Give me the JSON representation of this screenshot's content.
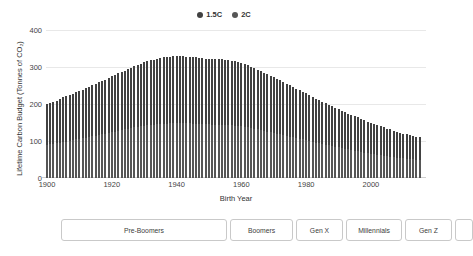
{
  "chart_data": {
    "type": "bar",
    "title": "",
    "xlabel": "Birth Year",
    "ylabel": "Lifetime Carbon Budget (Tonnes of CO2)",
    "ylabel_display": "Lifetime Carbon Budget (Tonnes of CO₂)",
    "xlim": [
      1900,
      2017
    ],
    "ylim": [
      0,
      430
    ],
    "yticks": [
      0,
      100,
      200,
      300,
      400
    ],
    "ytick_labels": [
      "0",
      "100",
      "200",
      "300",
      "400"
    ],
    "xticks": [
      1900,
      1920,
      1940,
      1960,
      1980,
      2000
    ],
    "xtick_labels": [
      "1900",
      "1920",
      "1940",
      "1960",
      "1980",
      "2000"
    ],
    "grid": "horizontal",
    "legend_position": "top-center",
    "stacked": true,
    "colors": {
      "1.5C": "#414141",
      "2C": "#565656",
      "grid": "#e8e8e8",
      "axis": "#cfcfcf"
    },
    "x": [
      1900,
      1901,
      1902,
      1903,
      1904,
      1905,
      1906,
      1907,
      1908,
      1909,
      1910,
      1911,
      1912,
      1913,
      1914,
      1915,
      1916,
      1917,
      1918,
      1919,
      1920,
      1921,
      1922,
      1923,
      1924,
      1925,
      1926,
      1927,
      1928,
      1929,
      1930,
      1931,
      1932,
      1933,
      1934,
      1935,
      1936,
      1937,
      1938,
      1939,
      1940,
      1941,
      1942,
      1943,
      1944,
      1945,
      1946,
      1947,
      1948,
      1949,
      1950,
      1951,
      1952,
      1953,
      1954,
      1955,
      1956,
      1957,
      1958,
      1959,
      1960,
      1961,
      1962,
      1963,
      1964,
      1965,
      1966,
      1967,
      1968,
      1969,
      1970,
      1971,
      1972,
      1973,
      1974,
      1975,
      1976,
      1977,
      1978,
      1979,
      1980,
      1981,
      1982,
      1983,
      1984,
      1985,
      1986,
      1987,
      1988,
      1989,
      1990,
      1991,
      1992,
      1993,
      1994,
      1995,
      1996,
      1997,
      1998,
      1999,
      2000,
      2001,
      2002,
      2003,
      2004,
      2005,
      2006,
      2007,
      2008,
      2009,
      2010,
      2011,
      2012,
      2013,
      2014,
      2015
    ],
    "series": [
      {
        "name": "1.5C",
        "values": [
          118,
          120,
          122,
          124,
          126,
          129,
          131,
          133,
          135,
          137,
          139,
          142,
          144,
          146,
          148,
          150,
          153,
          155,
          157,
          160,
          162,
          164,
          167,
          169,
          171,
          174,
          176,
          178,
          180,
          182,
          184,
          186,
          188,
          189,
          191,
          192,
          193,
          194,
          194,
          195,
          195,
          195,
          195,
          194,
          194,
          193,
          193,
          192,
          192,
          191,
          191,
          190,
          190,
          190,
          190,
          190,
          189,
          188,
          187,
          185,
          184,
          182,
          180,
          178,
          176,
          174,
          172,
          169,
          167,
          164,
          162,
          159,
          157,
          154,
          151,
          149,
          146,
          143,
          141,
          138,
          136,
          133,
          131,
          128,
          126,
          123,
          121,
          118,
          116,
          113,
          111,
          109,
          106,
          104,
          102,
          100,
          98,
          96,
          94,
          92,
          90,
          88,
          86,
          84,
          82,
          80,
          79,
          77,
          75,
          74,
          72,
          71,
          69,
          68,
          67,
          66
        ]
      },
      {
        "name": "2C",
        "values": [
          97,
          98,
          100,
          101,
          103,
          105,
          106,
          108,
          110,
          112,
          113,
          115,
          117,
          119,
          121,
          123,
          125,
          127,
          129,
          131,
          133,
          135,
          137,
          139,
          141,
          143,
          145,
          147,
          149,
          150,
          152,
          153,
          154,
          155,
          156,
          157,
          158,
          158,
          159,
          159,
          159,
          159,
          159,
          159,
          159,
          158,
          158,
          157,
          157,
          156,
          156,
          155,
          155,
          155,
          155,
          154,
          154,
          153,
          152,
          151,
          150,
          148,
          147,
          145,
          143,
          141,
          139,
          137,
          135,
          133,
          131,
          129,
          127,
          124,
          122,
          120,
          118,
          116,
          114,
          112,
          110,
          108,
          105,
          103,
          101,
          99,
          97,
          95,
          93,
          91,
          89,
          87,
          85,
          83,
          81,
          79,
          78,
          76,
          74,
          72,
          71,
          69,
          68,
          66,
          65,
          63,
          62,
          61,
          59,
          58,
          57,
          56,
          55,
          54,
          53,
          52
        ]
      }
    ],
    "totals": [
      215,
      218,
      222,
      225,
      229,
      234,
      237,
      241,
      245,
      249,
      252,
      257,
      261,
      265,
      269,
      273,
      278,
      282,
      286,
      291,
      295,
      299,
      304,
      308,
      312,
      317,
      321,
      325,
      329,
      332,
      336,
      339,
      342,
      344,
      347,
      349,
      351,
      352,
      353,
      354,
      354,
      354,
      354,
      353,
      353,
      351,
      351,
      349,
      349,
      347,
      347,
      345,
      345,
      345,
      345,
      344,
      343,
      341,
      339,
      336,
      334,
      330,
      327,
      323,
      319,
      315,
      311,
      306,
      302,
      297,
      293,
      288,
      284,
      278,
      273,
      269,
      264,
      259,
      255,
      250,
      246,
      241,
      236,
      231,
      227,
      222,
      218,
      213,
      209,
      204,
      200,
      196,
      191,
      187,
      183,
      179,
      176,
      172,
      168,
      164,
      161,
      157,
      154,
      150,
      147,
      143,
      141,
      138,
      134,
      132,
      129,
      127,
      124,
      122,
      120,
      118
    ],
    "peak": {
      "year": 1938,
      "value": 354
    },
    "first": {
      "year": 1900,
      "value": 215
    },
    "last": {
      "year": 2015,
      "value": 118
    }
  },
  "legend": {
    "items": [
      {
        "label": "1.5C",
        "color": "#414141",
        "marker": "circle"
      },
      {
        "label": "2C",
        "color": "#565656",
        "marker": "circle"
      }
    ]
  },
  "axes": {
    "y_title": "Lifetime Carbon Budget (Tonnes of CO₂)",
    "x_title": "Birth Year",
    "y_tick_labels": [
      "400",
      "300",
      "200",
      "100",
      "0"
    ],
    "x_tick_labels": [
      "1900",
      "1920",
      "1940",
      "1960",
      "1980",
      "2000"
    ]
  },
  "generations": {
    "items": [
      {
        "label": "Pre-Boomers",
        "width": 166
      },
      {
        "label": "Boomers",
        "width": 63
      },
      {
        "label": "Gen X",
        "width": 47
      },
      {
        "label": "Millennials",
        "width": 56
      },
      {
        "label": "Gen Z",
        "width": 47
      },
      {
        "label": "",
        "width": 18
      }
    ]
  }
}
